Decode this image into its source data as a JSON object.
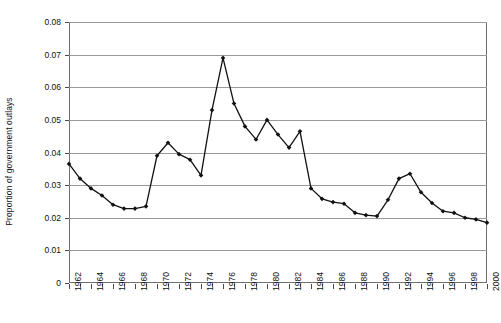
{
  "chart_data": {
    "type": "line",
    "title": "",
    "xlabel": "",
    "ylabel": "Proportion of government outlays",
    "ylim": [
      0,
      0.08
    ],
    "ytick_labels": [
      "0",
      "0.01",
      "0.02",
      "0.03",
      "0.04",
      "0.05",
      "0.06",
      "0.07",
      "0.08"
    ],
    "ytick_values": [
      0,
      0.01,
      0.02,
      0.03,
      0.04,
      0.05,
      0.06,
      0.07,
      0.08
    ],
    "xtick_labels": [
      "1962",
      "1964",
      "1966",
      "1968",
      "1970",
      "1972",
      "1974",
      "1976",
      "1978",
      "1980",
      "1982",
      "1984",
      "1986",
      "1988",
      "1990",
      "1992",
      "1994",
      "1996",
      "1998",
      "2000"
    ],
    "grid": "horizontal",
    "legend": "none",
    "marker": "diamond",
    "line_color": "#111111",
    "grid_color": "#9a9a9a",
    "frame_color": "#6f6f6f",
    "x": [
      1962,
      1963,
      1964,
      1965,
      1966,
      1967,
      1968,
      1969,
      1970,
      1971,
      1972,
      1973,
      1974,
      1975,
      1976,
      1977,
      1978,
      1979,
      1980,
      1981,
      1982,
      1983,
      1984,
      1985,
      1986,
      1987,
      1988,
      1989,
      1990,
      1991,
      1992,
      1993,
      1994,
      1995,
      1996,
      1997,
      1998,
      1999,
      2000
    ],
    "values": [
      0.0365,
      0.032,
      0.029,
      0.0268,
      0.024,
      0.0228,
      0.0228,
      0.0235,
      0.039,
      0.043,
      0.0395,
      0.0378,
      0.033,
      0.053,
      0.069,
      0.055,
      0.048,
      0.044,
      0.05,
      0.0455,
      0.0415,
      0.0465,
      0.029,
      0.0258,
      0.0248,
      0.0243,
      0.0215,
      0.0208,
      0.0205,
      0.0255,
      0.032,
      0.0335,
      0.0278,
      0.0245,
      0.022,
      0.0215,
      0.02,
      0.0195,
      0.0185
    ]
  },
  "axes": {
    "y_title": "Proportion of government outlays"
  }
}
